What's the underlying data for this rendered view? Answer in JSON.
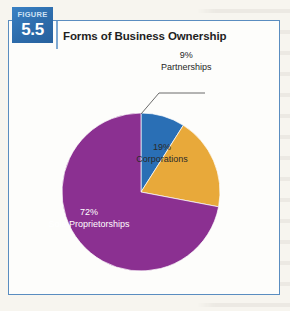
{
  "figure": {
    "badge_word": "FIGURE",
    "badge_number": "5.5",
    "title": "Forms of Business Ownership"
  },
  "colors": {
    "partnerships": "#2a6fb5",
    "corporations": "#e8a93a",
    "sole_proprietorships": "#8b3091",
    "frame_border": "#5a8dc0",
    "badge_blue": "#2d6cab",
    "page_background": "#f7f5ef",
    "panel_background": "#fdfdfb",
    "leader_line": "#5a5a5a"
  },
  "labels": {
    "partnerships": {
      "pct": "9%",
      "name": "Partnerships"
    },
    "corporations": {
      "pct": "19%",
      "name": "Corporations"
    },
    "sole_proprietorships": {
      "pct": "72%",
      "name": "Sole Proprietorships"
    }
  },
  "chart_data": {
    "type": "pie",
    "title": "Forms of Business Ownership",
    "subtitle": "",
    "xlabel": "",
    "ylabel": "",
    "grid": false,
    "legend": "none",
    "labels_inside_slices": true,
    "start_angle_deg": 0,
    "direction": "clockwise",
    "units": "percent",
    "total": 100,
    "categories": [
      "Partnerships",
      "Corporations",
      "Sole Proprietorships"
    ],
    "values": [
      9,
      19,
      72
    ],
    "colors": [
      "#2a6fb5",
      "#e8a93a",
      "#8b3091"
    ],
    "slices": [
      {
        "label": "Partnerships",
        "value": 9,
        "color": "#2a6fb5",
        "data_label": "9%",
        "label_placement": "outside-leader-line"
      },
      {
        "label": "Corporations",
        "value": 19,
        "color": "#e8a93a",
        "data_label": "19%",
        "label_placement": "inside"
      },
      {
        "label": "Sole Proprietorships",
        "value": 72,
        "color": "#8b3091",
        "data_label": "72%",
        "label_placement": "inside"
      }
    ],
    "annotations": [
      {
        "text": "9% Partnerships",
        "target": "Partnerships",
        "type": "leader-line"
      }
    ]
  }
}
